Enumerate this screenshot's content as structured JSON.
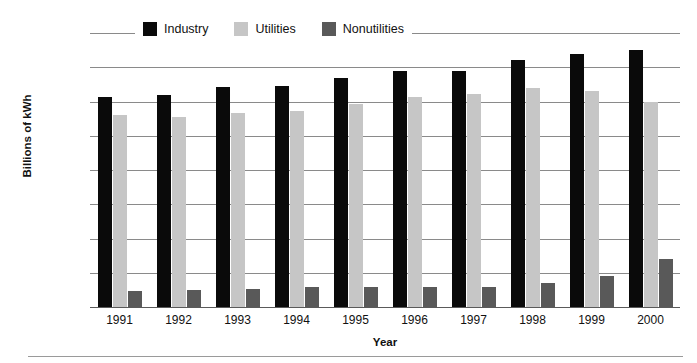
{
  "chart_data": {
    "type": "bar",
    "title": "",
    "xlabel": "Year",
    "ylabel": "Billions of kWh",
    "categories": [
      "1991",
      "1992",
      "1993",
      "1994",
      "1995",
      "1996",
      "1997",
      "1998",
      "1999",
      "2000"
    ],
    "ylim": [
      0,
      4000
    ],
    "yticks": [
      "0",
      "500",
      "1000",
      "1500",
      "2000",
      "2500",
      "3000",
      "3500",
      "4000"
    ],
    "ytick_values": [
      0,
      500,
      1000,
      1500,
      2000,
      2500,
      3000,
      3500,
      4000
    ],
    "grid": true,
    "legend_position": "top",
    "series": [
      {
        "name": "Industry",
        "color": "#0a0a0a",
        "values": [
          3070,
          3090,
          3210,
          3230,
          3340,
          3440,
          3450,
          3600,
          3690,
          3750
        ]
      },
      {
        "name": "Utilities",
        "color": "#c6c6c6",
        "values": [
          2810,
          2780,
          2830,
          2860,
          2970,
          3060,
          3110,
          3200,
          3160,
          2990
        ]
      },
      {
        "name": "Nonutilities",
        "color": "#595959",
        "values": [
          240,
          255,
          265,
          285,
          295,
          290,
          295,
          345,
          450,
          700
        ]
      }
    ]
  },
  "legend": {
    "items": [
      {
        "label": "Industry",
        "color": "#0a0a0a"
      },
      {
        "label": "Utilities",
        "color": "#c6c6c6"
      },
      {
        "label": "Nonutilities",
        "color": "#595959"
      }
    ]
  }
}
